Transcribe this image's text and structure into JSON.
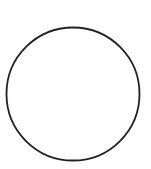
{
  "diagram": {
    "shape": "circle",
    "center": [
      73,
      94
    ],
    "radius": 66.5,
    "stroke_color": "#222222",
    "stroke_width": 1.8,
    "fill": "#ffffff"
  }
}
